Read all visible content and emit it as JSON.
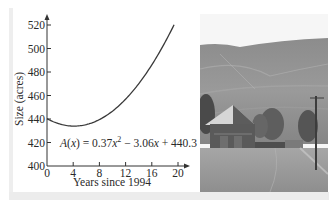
{
  "chart_data": {
    "type": "line",
    "title": "",
    "xlabel": "Years since 1994",
    "ylabel": "Size (acres)",
    "xlim": [
      0,
      20
    ],
    "ylim": [
      400,
      520
    ],
    "x_ticks": [
      0,
      4,
      8,
      12,
      16,
      20
    ],
    "y_ticks": [
      400,
      420,
      440,
      460,
      480,
      500,
      520
    ],
    "grid": false,
    "legend": null,
    "annotations": [
      "A(x) = 0.37x² − 3.06x + 440.3"
    ],
    "function": {
      "a": 0.37,
      "b": -3.06,
      "c": 440.3,
      "form": "A(x) = 0.37x^2 - 3.06x + 440.3"
    },
    "series": [
      {
        "name": "A(x)",
        "x": [
          0,
          2,
          4,
          6,
          8,
          10,
          12,
          14,
          16,
          18,
          19.4
        ],
        "values": [
          440.3,
          435.66,
          433.98,
          435.26,
          439.5,
          446.7,
          456.86,
          469.98,
          486.06,
          505.1,
          519.9
        ]
      }
    ]
  },
  "labels": {
    "y_ticks": [
      "400",
      "420",
      "440",
      "460",
      "480",
      "500",
      "520"
    ],
    "x_ticks": [
      "0",
      "4",
      "8",
      "12",
      "16",
      "20"
    ],
    "xlabel": "Years since 1994",
    "ylabel": "Size (acres)",
    "equation_prefix": "A(x) = 0.37x",
    "equation_sup": "2",
    "equation_suffix": " − 3.06x + 440.3"
  },
  "photo": {
    "subject": "farmland-barn-photo",
    "tones": {
      "sky": "#f4f4f4",
      "hill_dark": "#7d7d7d",
      "hill_light": "#a4a4a4",
      "field": "#9a9a9a",
      "barn": "#5a5a5a",
      "roof": "#d8d8d8"
    }
  }
}
